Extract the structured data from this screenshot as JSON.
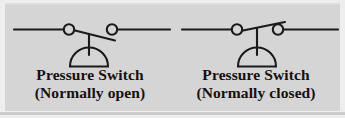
{
  "figure": {
    "background_color": "#d5d5d5",
    "margin_color": "#eeeeee",
    "ink_color": "#1a1a1a",
    "text_color": "#16100f"
  },
  "symbols": [
    {
      "id": "pressure-switch-normally-open",
      "state": "normally open",
      "caption_line1": "Pressure Switch",
      "caption_line2": "(Normally open)",
      "contacts": 2,
      "lever_direction": "down-right",
      "contact_made": false,
      "actuator": "diaphragm-dome"
    },
    {
      "id": "pressure-switch-normally-closed",
      "state": "normally closed",
      "caption_line1": "Pressure Switch",
      "caption_line2": "(Normally closed)",
      "contacts": 2,
      "lever_direction": "up-right",
      "contact_made": true,
      "actuator": "diaphragm-dome"
    }
  ]
}
